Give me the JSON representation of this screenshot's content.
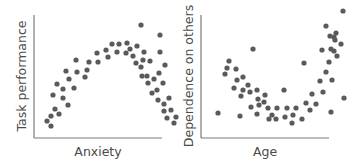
{
  "chart_data": [
    {
      "type": "scatter",
      "title": "",
      "xlabel": "Anxiety",
      "ylabel": "Task performance",
      "grid": false,
      "ticks": false,
      "point_color": "#5a5a5a",
      "axis_color": "#7a7a7a",
      "note": "Points in pixel coordinates (x from left edge of image, y from top). Shape: inverted U.",
      "points": [
        [
          47,
          121
        ],
        [
          51,
          126
        ],
        [
          51,
          116
        ],
        [
          59,
          114
        ],
        [
          55,
          109
        ],
        [
          53,
          95
        ],
        [
          57,
          84
        ],
        [
          63,
          98
        ],
        [
          63,
          89
        ],
        [
          68,
          105
        ],
        [
          69,
          79
        ],
        [
          66,
          71
        ],
        [
          74,
          88
        ],
        [
          77,
          72
        ],
        [
          76,
          60
        ],
        [
          85,
          77
        ],
        [
          87,
          70
        ],
        [
          89,
          62
        ],
        [
          97,
          53
        ],
        [
          98,
          62
        ],
        [
          106,
          50
        ],
        [
          108,
          57
        ],
        [
          112,
          44
        ],
        [
          117,
          52
        ],
        [
          119,
          44
        ],
        [
          126,
          53
        ],
        [
          127,
          43
        ],
        [
          130,
          49
        ],
        [
          133,
          56
        ],
        [
          137,
          46
        ],
        [
          136,
          63
        ],
        [
          141,
          67
        ],
        [
          144,
          52
        ],
        [
          142,
          76
        ],
        [
          143,
          60
        ],
        [
          147,
          76
        ],
        [
          148,
          83
        ],
        [
          150,
          61
        ],
        [
          141,
          25
        ],
        [
          152,
          93
        ],
        [
          154,
          79
        ],
        [
          157,
          90
        ],
        [
          158,
          100
        ],
        [
          159,
          73
        ],
        [
          160,
          35
        ],
        [
          160,
          52
        ],
        [
          163,
          83
        ],
        [
          165,
          65
        ],
        [
          164,
          111
        ],
        [
          169,
          98
        ],
        [
          171,
          110
        ],
        [
          167,
          118
        ],
        [
          174,
          123
        ],
        [
          176,
          117
        ],
        [
          164,
          104
        ]
      ]
    },
    {
      "type": "scatter",
      "title": "",
      "xlabel": "Age",
      "ylabel": "Dependence on others",
      "grid": false,
      "ticks": false,
      "point_color": "#5a5a5a",
      "axis_color": "#7a7a7a",
      "note": "Points in pixel coordinates (x from left edge of image, y from top). Shape: U.",
      "points": [
        [
          218,
          113
        ],
        [
          225,
          74
        ],
        [
          227,
          68
        ],
        [
          229,
          61
        ],
        [
          234,
          88
        ],
        [
          236,
          69
        ],
        [
          237,
          80
        ],
        [
          240,
          116
        ],
        [
          241,
          96
        ],
        [
          243,
          90
        ],
        [
          243,
          77
        ],
        [
          248,
          85
        ],
        [
          250,
          92
        ],
        [
          251,
          107
        ],
        [
          253,
          49
        ],
        [
          257,
          114
        ],
        [
          258,
          99
        ],
        [
          257,
          90
        ],
        [
          259,
          105
        ],
        [
          264,
          102
        ],
        [
          265,
          95
        ],
        [
          268,
          108
        ],
        [
          269,
          119
        ],
        [
          272,
          115
        ],
        [
          276,
          119
        ],
        [
          277,
          108
        ],
        [
          284,
          90
        ],
        [
          285,
          117
        ],
        [
          287,
          108
        ],
        [
          292,
          123
        ],
        [
          293,
          115
        ],
        [
          296,
          108
        ],
        [
          302,
          119
        ],
        [
          304,
          63
        ],
        [
          306,
          103
        ],
        [
          310,
          110
        ],
        [
          312,
          94
        ],
        [
          316,
          104
        ],
        [
          320,
          81
        ],
        [
          322,
          50
        ],
        [
          323,
          92
        ],
        [
          326,
          26
        ],
        [
          326,
          72
        ],
        [
          329,
          62
        ],
        [
          330,
          36
        ],
        [
          331,
          112
        ],
        [
          331,
          49
        ],
        [
          332,
          80
        ],
        [
          334,
          51
        ],
        [
          334,
          37
        ],
        [
          335,
          40
        ],
        [
          336,
          33
        ],
        [
          337,
          56
        ],
        [
          341,
          44
        ],
        [
          343,
          11
        ],
        [
          344,
          98
        ]
      ]
    }
  ],
  "charts": {
    "left": {
      "xlabel": "Anxiety",
      "ylabel": "Task performance"
    },
    "right": {
      "xlabel": "Age",
      "ylabel": "Dependence on others"
    }
  }
}
